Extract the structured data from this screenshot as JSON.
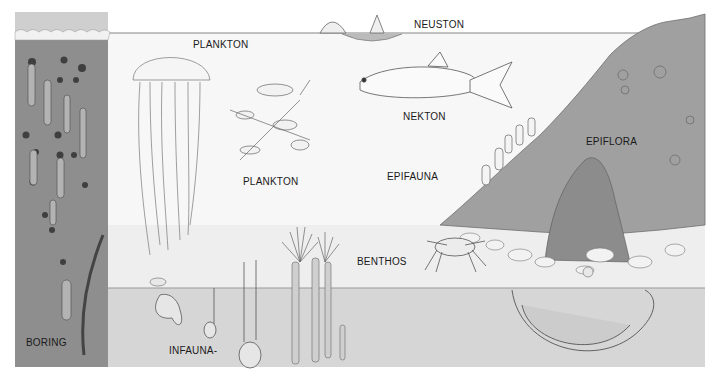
{
  "diagram": {
    "type": "marine ecological zones illustration",
    "colors": {
      "background": "#ffffff",
      "water": "#f6f6f6",
      "water_deep": "#ececec",
      "pier_wood": "#8e8e8e",
      "pier_dark": "#6a6a6a",
      "sediment": "#d6d6d6",
      "rock_slope": "#9c9c9c",
      "line": "#555555",
      "text": "#1a1a1a"
    },
    "labels": [
      {
        "id": "plankton-top",
        "text": "PLANKTON",
        "x": 193,
        "y": 39
      },
      {
        "id": "neuston",
        "text": "NEUSTON",
        "x": 414,
        "y": 19
      },
      {
        "id": "nekton",
        "text": "NEKTON",
        "x": 403,
        "y": 111
      },
      {
        "id": "epiflora",
        "text": "EPIFLORA",
        "x": 586,
        "y": 136
      },
      {
        "id": "plankton-mid",
        "text": "PLANKTON",
        "x": 243,
        "y": 176
      },
      {
        "id": "epifauna",
        "text": "EPIFAUNA",
        "x": 387,
        "y": 171
      },
      {
        "id": "benthos",
        "text": "BENTHOS",
        "x": 357,
        "y": 256
      },
      {
        "id": "boring",
        "text": "BORING",
        "x": 26,
        "y": 337
      },
      {
        "id": "infauna",
        "text": "INFAUNA-",
        "x": 169,
        "y": 345
      }
    ],
    "organisms": [
      "jellyfish",
      "zooplankton cluster",
      "fish",
      "sailing hydrozoan",
      "crab",
      "sea anemones",
      "tube worms",
      "burrowing clams",
      "U-shaped burrowing worm",
      "shipworm borings",
      "seaweed"
    ]
  }
}
